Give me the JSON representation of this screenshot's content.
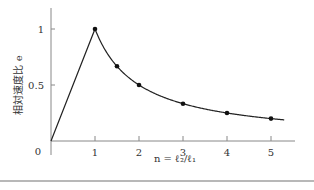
{
  "chart_data": {
    "type": "line",
    "title": "",
    "xlabel": "n = ℓ₂/ℓ₁",
    "ylabel": "相対速度比 e",
    "x_ticks": [
      "1",
      "2",
      "3",
      "4",
      "5"
    ],
    "y_ticks": [
      "0",
      "0.5",
      "1"
    ],
    "origin_label": "0",
    "xlim": [
      0,
      5.4
    ],
    "ylim": [
      0,
      1.2
    ],
    "grid": false,
    "legend": null,
    "series": [
      {
        "name": "e",
        "description": "e = n for n ≤ 1, e = 1/n for n ≥ 1",
        "curve_x": [
          0,
          1,
          1.25,
          1.5,
          1.75,
          2,
          2.5,
          3,
          3.5,
          4,
          4.5,
          5,
          5.3
        ],
        "curve_y": [
          0,
          1,
          0.8,
          0.667,
          0.571,
          0.5,
          0.4,
          0.333,
          0.286,
          0.25,
          0.222,
          0.2,
          0.189
        ],
        "markers_x": [
          1,
          1.5,
          2,
          3,
          4,
          5
        ],
        "markers_y": [
          1,
          0.667,
          0.5,
          0.333,
          0.25,
          0.2
        ]
      }
    ],
    "colors": {
      "line": "#222222",
      "axis": "#888888",
      "marker": "#111111"
    }
  }
}
